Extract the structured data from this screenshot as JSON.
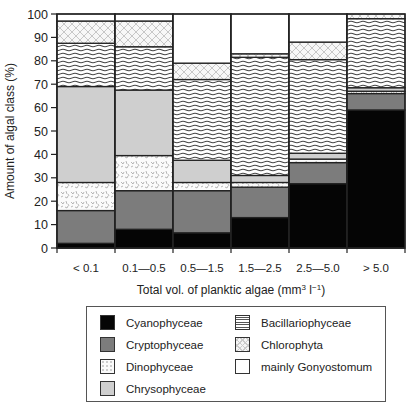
{
  "chart_data": {
    "type": "bar",
    "stacked": true,
    "title": "",
    "xlabel": "Total vol. of planktic algae (mm³ l⁻¹)",
    "ylabel": "Amount of algal class (%)",
    "ylim": [
      0,
      100
    ],
    "yticks": [
      0,
      10,
      20,
      30,
      40,
      50,
      60,
      70,
      80,
      90,
      100
    ],
    "grid": false,
    "legend_position": "below",
    "categories": [
      "< 0.1",
      "0.1—0.5",
      "0.5—1.5",
      "1.5—2.5",
      "2.5—5.0",
      "> 5.0"
    ],
    "series": [
      {
        "name": "Cyanophyceae",
        "fill": "solid-black",
        "values": [
          2,
          8,
          6.5,
          13,
          27.5,
          59
        ]
      },
      {
        "name": "Cryptophyceae",
        "fill": "dark-gray",
        "values": [
          14,
          16.5,
          18,
          13,
          9,
          7
        ]
      },
      {
        "name": "Dinophyceae",
        "fill": "speckled",
        "values": [
          12,
          15,
          3.5,
          2,
          1.5,
          1
        ]
      },
      {
        "name": "Chrysophyceae",
        "fill": "light-gray",
        "values": [
          41,
          28,
          9.5,
          3,
          2.5,
          1.5
        ]
      },
      {
        "name": "Bacillariophyceae",
        "fill": "wavy-lines",
        "values": [
          18.5,
          18.5,
          34.5,
          50.5,
          40,
          29.5
        ]
      },
      {
        "name": "Chlorophyta",
        "fill": "crosshatch",
        "values": [
          9.5,
          11,
          7,
          1.5,
          7.5,
          2
        ]
      },
      {
        "name": "mainly Gonyostomum",
        "fill": "white",
        "values": [
          3,
          3,
          21,
          17,
          12,
          0
        ]
      }
    ]
  },
  "axis": {
    "ylabel": "Amount of algal class (%)",
    "xlabel_main": "Total vol. of planktic algae (mm",
    "xlabel_sup1": "3",
    "xlabel_mid": " l",
    "xlabel_sup2": "−1",
    "xlabel_end": ")"
  },
  "legend": {
    "items": [
      {
        "label": "Cyanophyceae"
      },
      {
        "label": "Cryptophyceae"
      },
      {
        "label": "Dinophyceae"
      },
      {
        "label": "Chrysophyceae"
      },
      {
        "label": "Bacillariophyceae"
      },
      {
        "label": "Chlorophyta"
      },
      {
        "label": "mainly Gonyostomum"
      }
    ]
  }
}
